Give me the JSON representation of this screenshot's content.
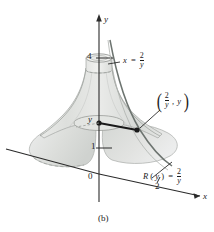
{
  "figure": {
    "caption": "(b)",
    "axes": {
      "y_axis_label": "y",
      "x_axis_label": "x",
      "y_ticks": [
        "4",
        "1"
      ],
      "origin_label": "0",
      "x_ticks": [
        "2"
      ],
      "y_variable_mark": "y"
    },
    "annotations": {
      "curve_equation": {
        "lhs": "x",
        "relation": "=",
        "num": "2",
        "den": "y"
      },
      "point_label": {
        "open": "(",
        "num": "2",
        "den": "y",
        "comma": ",",
        "second": "y",
        "close": ")"
      },
      "radius_label": {
        "lhs": "R",
        "arg_open": "(",
        "arg": "y",
        "arg_close": ")",
        "relation": "=",
        "num": "2",
        "den": "y"
      }
    },
    "colors": {
      "surface_fill": "#d9dad6",
      "surface_fill_light": "#e6e7e3",
      "outline": "#9a9d99",
      "axis": "#2b2b2b",
      "accent_dot": "#1a1a1a",
      "curve_dark": "#6d7470"
    }
  }
}
